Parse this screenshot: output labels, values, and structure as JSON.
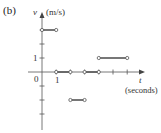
{
  "panel_label": "(b)",
  "chart_data": {
    "type": "line",
    "title": "",
    "xlabel": "t (seconds)",
    "ylabel": "v (m/s)",
    "x_axis_symbol": "t",
    "x_axis_unit": "(seconds)",
    "y_axis_symbol": "v",
    "y_axis_unit": "(m/s)",
    "x_tick_labels": [
      "0",
      "1"
    ],
    "y_tick_labels": [
      "1"
    ],
    "xlim": [
      0,
      7
    ],
    "ylim": [
      -4,
      4
    ],
    "grid": false,
    "legend": null,
    "step_segments": [
      {
        "t_start": 0,
        "t_end": 1,
        "v": 3
      },
      {
        "t_start": 1,
        "t_end": 2,
        "v": 0
      },
      {
        "t_start": 2,
        "t_end": 3,
        "v": -2
      },
      {
        "t_start": 3,
        "t_end": 4,
        "v": 0
      },
      {
        "t_start": 4,
        "t_end": 6,
        "v": 1
      }
    ],
    "open_endpoints": true
  },
  "colors": {
    "axis": "#555555",
    "segment": "#555555",
    "text": "#333333"
  }
}
